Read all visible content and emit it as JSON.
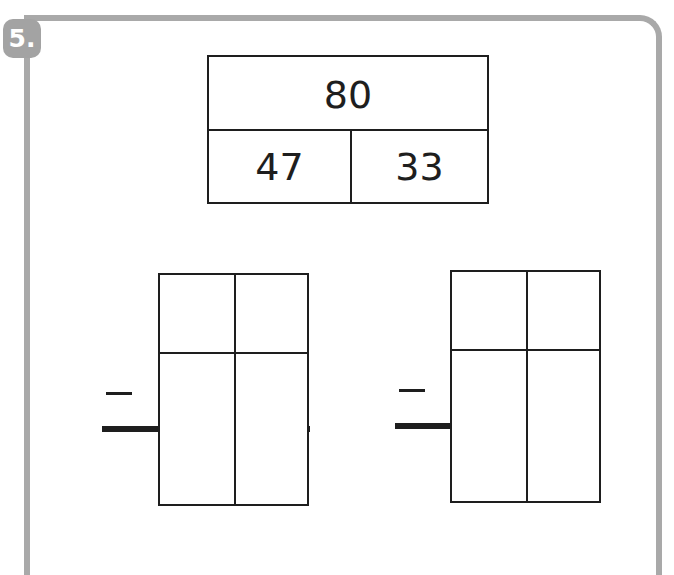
{
  "exercise": {
    "number_label": "5."
  },
  "number_bond": {
    "whole": "80",
    "parts": [
      "47",
      "33"
    ]
  },
  "subtraction_grids": [
    {
      "operator": "−",
      "rows": 3,
      "columns": 2,
      "cells": [
        [
          "",
          ""
        ],
        [
          "",
          ""
        ],
        [
          "",
          ""
        ]
      ]
    },
    {
      "operator": "−",
      "rows": 3,
      "columns": 2,
      "cells": [
        [
          "",
          ""
        ],
        [
          "",
          ""
        ],
        [
          "",
          ""
        ]
      ]
    }
  ],
  "colors": {
    "frame": "#a9a9a9",
    "badge": "#a3a3a3",
    "ink": "#1e1e1e"
  }
}
